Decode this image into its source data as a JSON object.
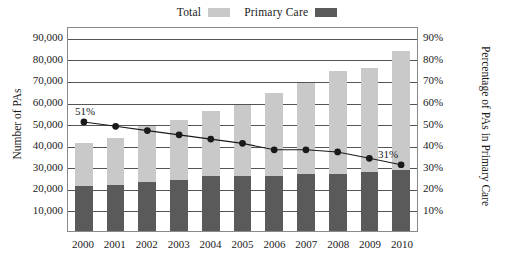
{
  "legend": {
    "entries": [
      {
        "label": "Total",
        "color": "#c9c9c9",
        "name": "legend-total"
      },
      {
        "label": "Primary Care",
        "color": "#5a5a5a",
        "name": "legend-primary-care"
      }
    ]
  },
  "axes": {
    "y_left_title": "Number of PAs",
    "y_right_title": "Percentage of PAs in Primary Care",
    "y_left_ticks": [
      "90,000",
      "80,000",
      "70,000",
      "60,000",
      "50,000",
      "40,000",
      "30,000",
      "20,000",
      "10,000"
    ],
    "y_right_ticks": [
      "90%",
      "80%",
      "70%",
      "60%",
      "50%",
      "40%",
      "30%",
      "20%",
      "10%"
    ]
  },
  "annotations": {
    "first_point": "51%",
    "last_point": "31%"
  },
  "chart_data": {
    "type": "bar",
    "title": "",
    "subtitle": "",
    "xlabel": "",
    "ylabel": "Number of PAs",
    "y2label": "Percentage of PAs in Primary Care",
    "categories": [
      "2000",
      "2001",
      "2002",
      "2003",
      "2004",
      "2005",
      "2006",
      "2007",
      "2008",
      "2009",
      "2010"
    ],
    "ylim": [
      0,
      95000
    ],
    "y2lim": [
      0,
      95
    ],
    "grid": true,
    "legend_position": "top-center",
    "stacked": true,
    "series": [
      {
        "name": "Total",
        "type": "bar",
        "color": "#c9c9c9",
        "axis": "left",
        "values": [
          41000,
          43000,
          48500,
          51500,
          55500,
          58500,
          64000,
          68500,
          74000,
          75500,
          83500
        ]
      },
      {
        "name": "Primary Care",
        "type": "bar",
        "color": "#5a5a5a",
        "axis": "left",
        "values": [
          21000,
          21500,
          22500,
          23500,
          25500,
          25500,
          25500,
          26500,
          26500,
          27500,
          28500
        ]
      },
      {
        "name": "Percentage of PAs in Primary Care",
        "type": "line",
        "color": "#1a1a1a",
        "axis": "right",
        "values": [
          51,
          49,
          47,
          45,
          43,
          41,
          38,
          38,
          37,
          34,
          31
        ],
        "point_labels": {
          "2000": "51%",
          "2010": "31%"
        }
      }
    ]
  },
  "colors": {
    "total_bar": "#c9c9c9",
    "primary_bar": "#5a5a5a",
    "line": "#1a1a1a",
    "grid": "#555555",
    "plot_border": "#8a8a8a",
    "text": "#1a1a1a"
  }
}
